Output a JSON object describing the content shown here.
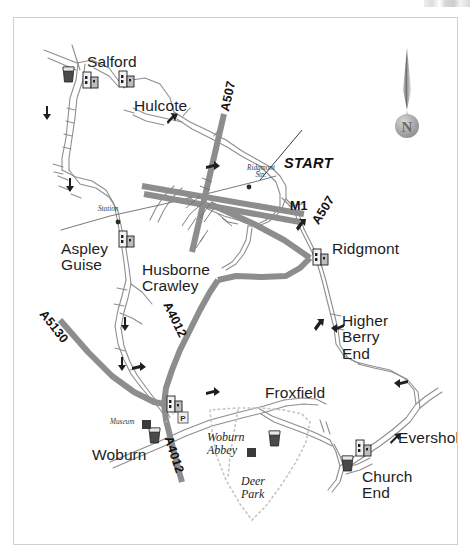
{
  "map": {
    "title": "Woburn area road map",
    "background_color": "#ffffff",
    "border_color": "#cfcfcf",
    "road_major_color": "#8d8d8d",
    "road_minor_color": "#9a9a9a",
    "ink_color": "#1d1d1d",
    "compass": {
      "icon": "compass-north-needle",
      "label": "N"
    },
    "start_marker": {
      "label": "START"
    },
    "places": [
      {
        "id": "salford",
        "label": "Salford",
        "x": 86,
        "y": 44,
        "style": "place"
      },
      {
        "id": "hulcote",
        "label": "Hulcote",
        "x": 133,
        "y": 88,
        "style": "place"
      },
      {
        "id": "aspley-guise",
        "label": "Aspley\nGuise",
        "x": 60,
        "y": 231,
        "style": "place"
      },
      {
        "id": "husborne-crawley",
        "label": "Husborne\nCrawley",
        "x": 141,
        "y": 252,
        "style": "place"
      },
      {
        "id": "ridgmont",
        "label": "Ridgmont",
        "x": 331,
        "y": 231,
        "style": "place"
      },
      {
        "id": "higher-berry-end",
        "label": "Higher\nBerry\nEnd",
        "x": 341,
        "y": 303,
        "style": "place"
      },
      {
        "id": "froxfield",
        "label": "Froxfield",
        "x": 264,
        "y": 375,
        "style": "place"
      },
      {
        "id": "eversholt",
        "label": "Eversholt",
        "x": 397,
        "y": 420,
        "style": "place"
      },
      {
        "id": "church-end",
        "label": "Church\nEnd",
        "x": 361,
        "y": 459,
        "style": "place"
      },
      {
        "id": "woburn",
        "label": "Woburn",
        "x": 91,
        "y": 437,
        "style": "place"
      }
    ],
    "features": [
      {
        "id": "woburn-abbey",
        "label": "Woburn\nAbbey",
        "x": 206,
        "y": 421,
        "style": "feature"
      },
      {
        "id": "deer-park",
        "label": "Deer\nPark",
        "x": 240,
        "y": 465,
        "style": "feature"
      }
    ],
    "minor_labels": [
      {
        "id": "station",
        "label": "Station",
        "x": 97,
        "y": 196
      },
      {
        "id": "ridgmont-stn",
        "label": "Ridgmont\nStn.",
        "x": 246,
        "y": 155
      },
      {
        "id": "museum",
        "label": "Museum",
        "x": 109,
        "y": 409
      }
    ],
    "road_numbers": [
      {
        "id": "a507-north",
        "label": "A507",
        "x": 213,
        "y": 100,
        "rotate": -78
      },
      {
        "id": "m1",
        "label": "M1",
        "x": 288,
        "y": 190,
        "rotate": 0
      },
      {
        "id": "a507-east",
        "label": "A507",
        "x": 306,
        "y": 210,
        "rotate": -58
      },
      {
        "id": "a5130",
        "label": "A5130",
        "x": 44,
        "y": 300,
        "rotate": 52
      },
      {
        "id": "a4012-mid",
        "label": "A4012",
        "x": 168,
        "y": 292,
        "rotate": 64
      },
      {
        "id": "a4012-low",
        "label": "A4012",
        "x": 170,
        "y": 427,
        "rotate": 72
      }
    ],
    "poi_icons": [
      {
        "id": "pub-salford-west",
        "icon": "pub-glass-icon",
        "x": 62,
        "y": 66
      },
      {
        "id": "church-salford",
        "icon": "church-icon",
        "x": 82,
        "y": 69
      },
      {
        "id": "church-hulcote",
        "icon": "church-icon",
        "x": 118,
        "y": 68
      },
      {
        "id": "church-aspley",
        "icon": "church-icon",
        "x": 118,
        "y": 228
      },
      {
        "id": "church-ridgmont",
        "icon": "church-icon",
        "x": 312,
        "y": 246
      },
      {
        "id": "church-woburn",
        "icon": "church-icon",
        "x": 166,
        "y": 393
      },
      {
        "id": "parking-woburn",
        "icon": "parking-icon",
        "x": 177,
        "y": 411
      },
      {
        "id": "museum-woburn",
        "icon": "museum-square-icon",
        "x": 141,
        "y": 418
      },
      {
        "id": "pub-woburn",
        "icon": "pub-glass-icon",
        "x": 148,
        "y": 427
      },
      {
        "id": "site-deer-park",
        "icon": "museum-square-icon",
        "x": 246,
        "y": 446
      },
      {
        "id": "pub-abbey",
        "icon": "pub-glass-icon",
        "x": 268,
        "y": 430
      },
      {
        "id": "pub-church-end",
        "icon": "pub-glass-icon",
        "x": 341,
        "y": 455
      },
      {
        "id": "church-church-end",
        "icon": "church-icon",
        "x": 355,
        "y": 437
      }
    ]
  }
}
